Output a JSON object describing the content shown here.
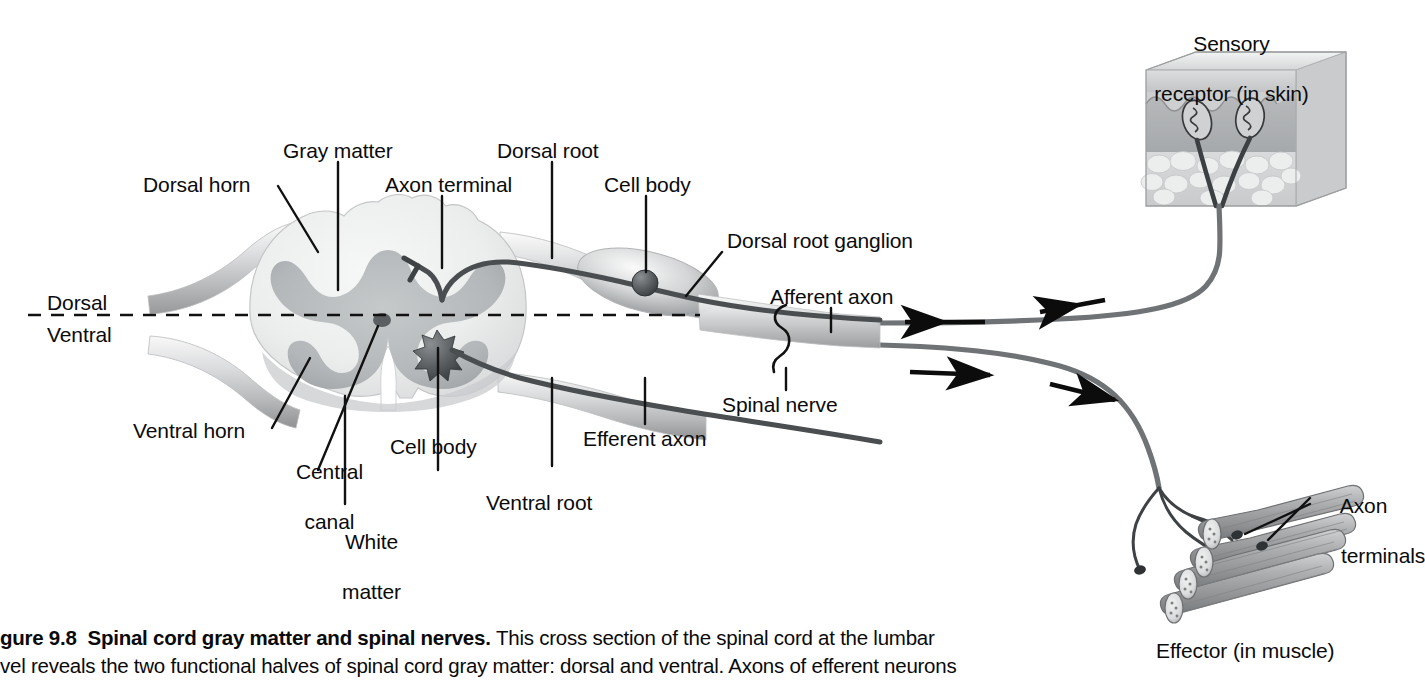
{
  "figure": {
    "number": "gure 9.8",
    "title": "Spinal cord gray matter and spinal nerves.",
    "caption_line1": "This cross section of the spinal cord at the lumbar",
    "caption_line2": "vel reveals the two functional halves of spinal cord gray matter: dorsal and ventral. Axons of efferent neurons"
  },
  "labels": {
    "sensory_receptor_l1": "Sensory",
    "sensory_receptor_l2": "receptor (in skin)",
    "gray_matter": "Gray matter",
    "dorsal_root": "Dorsal root",
    "dorsal_horn": "Dorsal horn",
    "axon_terminal": "Axon terminal",
    "cell_body_dorsal": "Cell body",
    "dorsal_root_ganglion": "Dorsal root ganglion",
    "afferent_axon": "Afferent axon",
    "dorsal": "Dorsal",
    "ventral": "Ventral",
    "spinal_nerve": "Spinal nerve",
    "ventral_horn": "Ventral horn",
    "central_canal_l1": "Central",
    "central_canal_l2": "canal",
    "cell_body_ventral": "Cell body",
    "efferent_axon": "Efferent axon",
    "white_matter_l1": "White",
    "white_matter_l2": "matter",
    "ventral_root": "Ventral root",
    "axon_terminals_l1": "Axon",
    "axon_terminals_l2": "terminals",
    "effector": "Effector (in muscle)"
  },
  "colors": {
    "white_matter": "#eceded",
    "gray_matter": "#b9bcbd",
    "nerve": "#6f7375",
    "axon_line": "#4a4e50",
    "label_text": "#0b0b0b",
    "skin_epidermis": "#d8d9da",
    "skin_dermis": "#b3b5b7",
    "muscle": "#9a9c9e",
    "background": "#ffffff"
  },
  "flow": {
    "afferent_direction": "toward-spinal-cord",
    "efferent_direction": "away-from-spinal-cord",
    "arrow_count_afferent": 2,
    "arrow_count_efferent": 2
  }
}
